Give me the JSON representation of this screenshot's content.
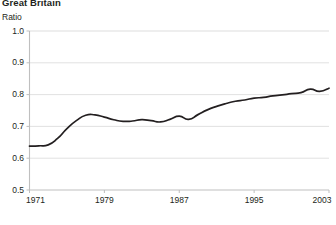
{
  "figure": {
    "title": "Great Britain",
    "unit_label": "Ratio"
  },
  "colors": {
    "line": "#231f20",
    "grid": "#d9d9d9",
    "axis": "#bfbfbf",
    "text": "#231f20"
  },
  "chart_data": {
    "type": "line",
    "title": "Great Britain",
    "subtitle": "",
    "xlabel": "",
    "ylabel": "Ratio",
    "ylim": [
      0.5,
      1.0
    ],
    "xlim": [
      1971,
      2003
    ],
    "grid": true,
    "legend": null,
    "ytick_labels": [
      "1.0",
      "0.9",
      "0.8",
      "0.7",
      "0.6",
      "0.5"
    ],
    "ytick_values": [
      1.0,
      0.9,
      0.8,
      0.7,
      0.6,
      0.5
    ],
    "xtick_labels": [
      "1971",
      "1979",
      "1987",
      "1995",
      "2003"
    ],
    "xtick_values": [
      1971,
      1979,
      1987,
      1995,
      2003
    ],
    "series": [
      {
        "name": "Ratio",
        "x": [
          1971,
          1972,
          1973,
          1974,
          1975,
          1976,
          1977,
          1978,
          1979,
          1980,
          1981,
          1982,
          1983,
          1984,
          1985,
          1986,
          1987,
          1988,
          1989,
          1990,
          1991,
          1992,
          1993,
          1994,
          1995,
          1996,
          1997,
          1998,
          1999,
          2000,
          2001,
          2002,
          2003
        ],
        "values": [
          0.638,
          0.639,
          0.642,
          0.662,
          0.693,
          0.718,
          0.735,
          0.736,
          0.729,
          0.721,
          0.716,
          0.717,
          0.721,
          0.718,
          0.714,
          0.722,
          0.732,
          0.722,
          0.737,
          0.752,
          0.763,
          0.772,
          0.779,
          0.783,
          0.789,
          0.791,
          0.796,
          0.799,
          0.803,
          0.806,
          0.817,
          0.81,
          0.82
        ]
      }
    ]
  }
}
